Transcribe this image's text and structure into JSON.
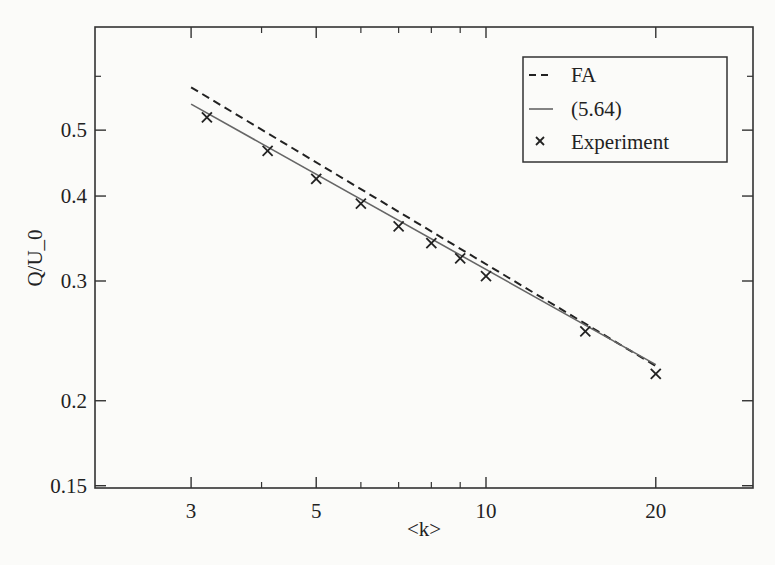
{
  "chart_data": {
    "type": "line",
    "title": "",
    "xlabel": "<k>",
    "ylabel": "Q/U_0",
    "xscale": "log",
    "yscale": "log",
    "xlim": [
      1.9,
      34
    ],
    "ylim": [
      0.15,
      0.62
    ],
    "xticks": [
      3,
      5,
      10,
      20
    ],
    "xtick_labels": [
      "3",
      "5",
      "10",
      "20"
    ],
    "x_minor_ticks": [
      4,
      6,
      7,
      8,
      9
    ],
    "yticks": [
      0.15,
      0.2,
      0.3,
      0.4,
      0.5
    ],
    "ytick_labels": [
      "0.15",
      "0.2",
      "0.3",
      "0.4",
      "0.5"
    ],
    "y_minor_ticks": [
      0.6
    ],
    "grid": false,
    "legend_position": "upper right",
    "series": [
      {
        "name": "FA",
        "style": "dashed",
        "color": "#222222",
        "x": [
          3,
          20
        ],
        "y": [
          0.578,
          0.225
        ]
      },
      {
        "name": "(5.64)",
        "style": "solid",
        "color": "#666666",
        "x": [
          3,
          20
        ],
        "y": [
          0.546,
          0.226
        ]
      },
      {
        "name": "Experiment",
        "style": "marker-x",
        "color": "#222222",
        "x": [
          3.2,
          4.1,
          5,
          6,
          7,
          8,
          9,
          10,
          15,
          20
        ],
        "y": [
          0.522,
          0.466,
          0.424,
          0.39,
          0.361,
          0.341,
          0.324,
          0.305,
          0.253,
          0.219
        ]
      }
    ]
  },
  "legend": {
    "items": [
      {
        "label": "FA"
      },
      {
        "label": "(5.64)"
      },
      {
        "label": "Experiment"
      }
    ]
  },
  "axes": {
    "xlabel": "<k>",
    "ylabel": "Q/U_0"
  }
}
